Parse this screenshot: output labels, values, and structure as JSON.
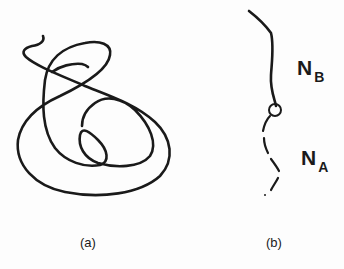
{
  "panels": [
    {
      "id": "a",
      "caption": "(a)",
      "description": "Tangled single polymer chain (random coil)"
    },
    {
      "id": "b",
      "caption": "(b)",
      "description": "Diblock chain with junction point",
      "blocks": [
        {
          "label": "N",
          "subscript": "B",
          "style": "solid"
        },
        {
          "label": "N",
          "subscript": "A",
          "style": "dashed"
        }
      ],
      "junction": "circle"
    }
  ],
  "colors": {
    "stroke": "#1a1a1a",
    "background": "#fdfdfd"
  }
}
